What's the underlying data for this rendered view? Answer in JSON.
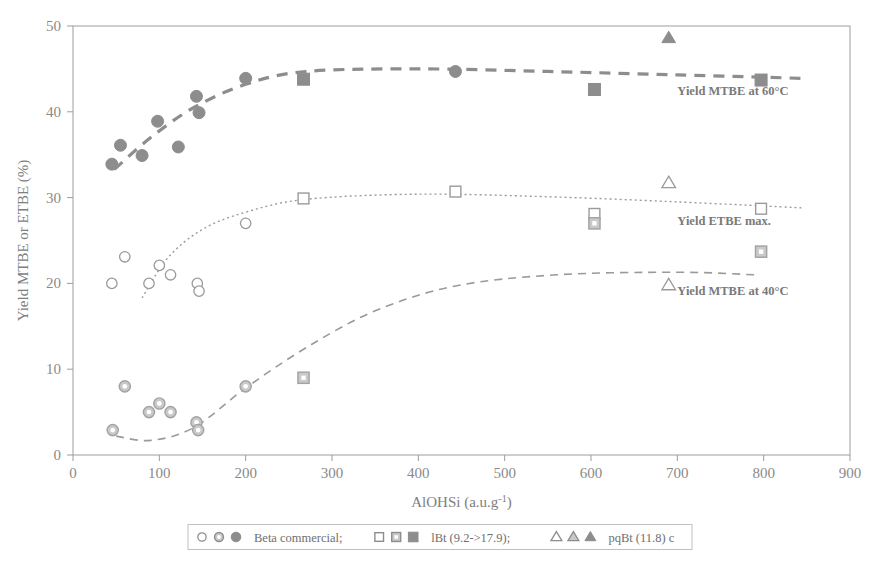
{
  "chart_data": {
    "type": "scatter",
    "title": "",
    "xlabel": "AlOHSi (a.u.g",
    "xlabel_sup": "-1",
    "xlabel_close": ")",
    "ylabel": "Yield MTBE or ETBE (%)",
    "xlim": [
      0,
      900
    ],
    "ylim": [
      0,
      50
    ],
    "xticks": [
      "0",
      "100",
      "200",
      "300",
      "400",
      "500",
      "600",
      "700",
      "800",
      "900"
    ],
    "xtick_values": [
      0,
      100,
      200,
      300,
      400,
      500,
      600,
      700,
      800,
      900
    ],
    "yticks": [
      "0",
      "10",
      "20",
      "30",
      "40",
      "50"
    ],
    "ytick_values": [
      0,
      10,
      20,
      30,
      40,
      50
    ],
    "grid": false,
    "legend_position": "bottom-outside",
    "series": [
      {
        "name": "Beta commercial - Yield MTBE at 60C",
        "marker": "filled-circle",
        "color": "#8d8d8d",
        "points": [
          {
            "x": 45,
            "y": 33.9
          },
          {
            "x": 55,
            "y": 36.1
          },
          {
            "x": 80,
            "y": 34.9
          },
          {
            "x": 98,
            "y": 38.9
          },
          {
            "x": 122,
            "y": 35.9
          },
          {
            "x": 143,
            "y": 41.8
          },
          {
            "x": 146,
            "y": 39.9
          },
          {
            "x": 200,
            "y": 43.9
          },
          {
            "x": 443,
            "y": 44.7
          }
        ]
      },
      {
        "name": "Beta commercial - Yield ETBE max.",
        "marker": "open-circle",
        "color": "#9a9a9a",
        "points": [
          {
            "x": 45,
            "y": 20.0
          },
          {
            "x": 60,
            "y": 23.1
          },
          {
            "x": 88,
            "y": 20.0
          },
          {
            "x": 100,
            "y": 22.1
          },
          {
            "x": 113,
            "y": 21.0
          },
          {
            "x": 144,
            "y": 20.0
          },
          {
            "x": 146,
            "y": 19.1
          },
          {
            "x": 200,
            "y": 27.0
          }
        ]
      },
      {
        "name": "Beta commercial - Yield MTBE at 40C",
        "marker": "halftone-circle",
        "color": "#a2a2a2",
        "points": [
          {
            "x": 46,
            "y": 2.9
          },
          {
            "x": 60,
            "y": 8.0
          },
          {
            "x": 88,
            "y": 5.0
          },
          {
            "x": 100,
            "y": 6.0
          },
          {
            "x": 113,
            "y": 5.0
          },
          {
            "x": 143,
            "y": 3.8
          },
          {
            "x": 145,
            "y": 2.9
          },
          {
            "x": 200,
            "y": 8.0
          }
        ]
      },
      {
        "name": "lBt (9.2->17.9) - Yield MTBE at 60C",
        "marker": "filled-square",
        "color": "#8d8d8d",
        "points": [
          {
            "x": 267,
            "y": 43.8
          },
          {
            "x": 604,
            "y": 42.6
          },
          {
            "x": 797,
            "y": 43.7
          }
        ]
      },
      {
        "name": "lBt (9.2->17.9) - Yield ETBE max.",
        "marker": "open-square",
        "color": "#9a9a9a",
        "points": [
          {
            "x": 267,
            "y": 29.9
          },
          {
            "x": 443,
            "y": 30.7
          },
          {
            "x": 604,
            "y": 28.1
          },
          {
            "x": 797,
            "y": 28.7
          }
        ]
      },
      {
        "name": "lBt (9.2->17.9) - Yield MTBE at 40C",
        "marker": "halftone-square",
        "color": "#a2a2a2",
        "points": [
          {
            "x": 267,
            "y": 9.0
          },
          {
            "x": 604,
            "y": 27.0
          },
          {
            "x": 797,
            "y": 23.7
          }
        ]
      },
      {
        "name": "pqBt (11.8) c - Yield MTBE at 60C",
        "marker": "filled-triangle",
        "color": "#8d8d8d",
        "points": [
          {
            "x": 690,
            "y": 48.6
          }
        ]
      },
      {
        "name": "pqBt (11.8) c - Yield ETBE max.",
        "marker": "open-triangle",
        "color": "#9a9a9a",
        "points": [
          {
            "x": 690,
            "y": 31.7
          }
        ]
      },
      {
        "name": "pqBt (11.8) c - Yield MTBE at 40C",
        "marker": "open-triangle",
        "color": "#9a9a9a",
        "points": [
          {
            "x": 690,
            "y": 19.8
          }
        ]
      },
      {
        "name": "Open circle at 443 ETBE",
        "marker": "open-circle",
        "color": "#9a9a9a",
        "points": []
      }
    ],
    "trend_curves": [
      {
        "name": "Yield MTBE at 60C",
        "style": "dashed-thick",
        "color": "#8d8d8d",
        "path": [
          {
            "x": 48,
            "y": 33.3
          },
          {
            "x": 90,
            "y": 37.0
          },
          {
            "x": 140,
            "y": 40.5
          },
          {
            "x": 200,
            "y": 43.2
          },
          {
            "x": 270,
            "y": 44.7
          },
          {
            "x": 400,
            "y": 45.0
          },
          {
            "x": 550,
            "y": 44.7
          },
          {
            "x": 700,
            "y": 44.3
          },
          {
            "x": 845,
            "y": 43.9
          }
        ]
      },
      {
        "name": "Yield ETBE max.",
        "style": "dotted",
        "color": "#9a9a9a",
        "path": [
          {
            "x": 80,
            "y": 18.3
          },
          {
            "x": 110,
            "y": 23.0
          },
          {
            "x": 150,
            "y": 26.3
          },
          {
            "x": 200,
            "y": 28.3
          },
          {
            "x": 270,
            "y": 29.8
          },
          {
            "x": 400,
            "y": 30.4
          },
          {
            "x": 550,
            "y": 30.1
          },
          {
            "x": 700,
            "y": 29.5
          },
          {
            "x": 845,
            "y": 28.8
          }
        ]
      },
      {
        "name": "Yield MTBE at 40C",
        "style": "dashed",
        "color": "#9a9a9a",
        "path": [
          {
            "x": 50,
            "y": 2.2
          },
          {
            "x": 90,
            "y": 1.7
          },
          {
            "x": 140,
            "y": 3.2
          },
          {
            "x": 200,
            "y": 7.8
          },
          {
            "x": 270,
            "y": 12.5
          },
          {
            "x": 350,
            "y": 16.8
          },
          {
            "x": 443,
            "y": 19.7
          },
          {
            "x": 560,
            "y": 21.0
          },
          {
            "x": 700,
            "y": 21.3
          },
          {
            "x": 790,
            "y": 21.0
          }
        ]
      }
    ],
    "annotations": [
      {
        "text": "Yield MTBE at 60°C",
        "x": 700,
        "y": 42.0
      },
      {
        "text": "Yield ETBE max.",
        "x": 700,
        "y": 26.8
      },
      {
        "text": "Yield MTBE at 40°C",
        "x": 700,
        "y": 18.6
      }
    ],
    "legend": [
      {
        "label": "Beta commercial;",
        "markers": [
          "open-circle",
          "halftone-circle",
          "filled-circle"
        ]
      },
      {
        "label": "lBt (9.2->17.9);",
        "markers": [
          "open-square",
          "halftone-square",
          "filled-square"
        ]
      },
      {
        "label": "pqBt (11.8) c",
        "markers": [
          "open-triangle",
          "halftone-triangle",
          "filled-triangle"
        ]
      }
    ]
  }
}
